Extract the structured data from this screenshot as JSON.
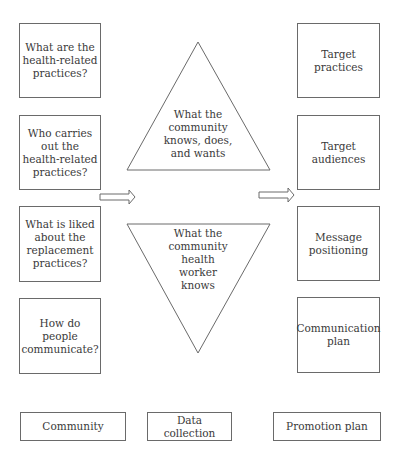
{
  "diagram": {
    "left_column": [
      {
        "label": "What are the health-related practices?"
      },
      {
        "label": "Who carries out the health-related practices?"
      },
      {
        "label": "What is liked about the replacement practices?"
      },
      {
        "label": "How do people communicate?"
      }
    ],
    "center": {
      "upper_triangle": {
        "label": "What the community knows, does, and wants"
      },
      "lower_triangle": {
        "label": "What the community health worker knows"
      }
    },
    "right_column": [
      {
        "label": "Target practices"
      },
      {
        "label": "Target audiences"
      },
      {
        "label": "Message positioning"
      },
      {
        "label": "Communication plan"
      }
    ],
    "footer": {
      "left": "Community",
      "center": "Data collection",
      "right": "Promotion plan"
    }
  }
}
